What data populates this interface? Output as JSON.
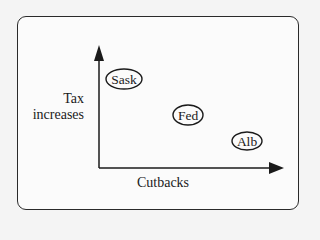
{
  "diagram": {
    "type": "positioning-map",
    "y_axis": {
      "label_line1": "Tax",
      "label_line2": "increases"
    },
    "x_axis": {
      "label": "Cutbacks"
    },
    "nodes": [
      {
        "label": "Sask",
        "cx": 124,
        "cy": 79,
        "rx": 18,
        "ry": 10
      },
      {
        "label": "Fed",
        "cx": 188,
        "cy": 115,
        "rx": 15,
        "ry": 10
      },
      {
        "label": "Alb",
        "cx": 247,
        "cy": 141,
        "rx": 15,
        "ry": 9
      }
    ],
    "colors": {
      "stroke": "#1a1a1a",
      "frame": "#2a2a2a",
      "background": "#fbfbfb"
    }
  }
}
